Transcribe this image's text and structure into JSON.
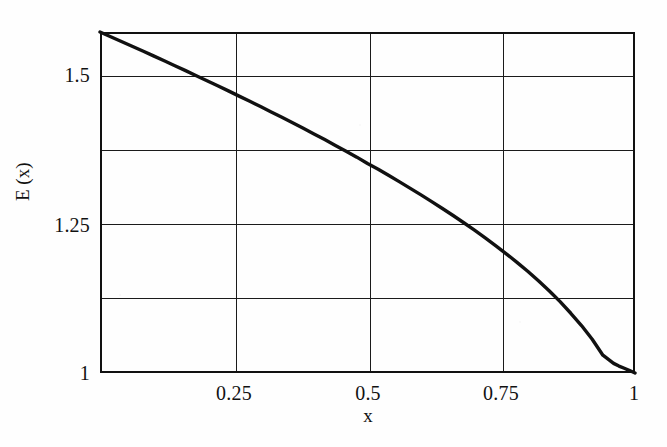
{
  "chart_data": {
    "type": "line",
    "title": "",
    "subtitle": "",
    "xlabel": "x",
    "ylabel": "E (x)",
    "xlim": [
      0,
      1
    ],
    "ylim": [
      1,
      1.5708
    ],
    "grid": true,
    "legend": null,
    "x_ticks": [
      {
        "value": 0.25,
        "label": "0.25"
      },
      {
        "value": 0.5,
        "label": "0.5"
      },
      {
        "value": 0.75,
        "label": "0.75"
      },
      {
        "value": 1,
        "label": "1"
      }
    ],
    "y_ticks": [
      {
        "value": 1.5,
        "label": "1.5"
      },
      {
        "value": 1.25,
        "label": "1.25"
      },
      {
        "value": 1,
        "label": "1"
      }
    ],
    "x_gridlines": [
      0.25,
      0.5,
      0.75
    ],
    "y_gridlines": [
      1.5,
      1.375,
      1.25,
      1.125
    ],
    "line_color": "#111111",
    "line_width": 3.4,
    "series": [
      {
        "name": "E (x)",
        "x": [
          0,
          0.02,
          0.04,
          0.06,
          0.08,
          0.1,
          0.12,
          0.14,
          0.16,
          0.18,
          0.2,
          0.22,
          0.24,
          0.26,
          0.28,
          0.3,
          0.32,
          0.34,
          0.36,
          0.38,
          0.4,
          0.42,
          0.44,
          0.46,
          0.48,
          0.5,
          0.52,
          0.54,
          0.56,
          0.58,
          0.6,
          0.62,
          0.64,
          0.66,
          0.68,
          0.7,
          0.72,
          0.74,
          0.76,
          0.78,
          0.8,
          0.82,
          0.84,
          0.86,
          0.88,
          0.9,
          0.92,
          0.94,
          0.96,
          0.97,
          0.98,
          0.99,
          0.995,
          1
        ],
        "values": [
          1.5708,
          1.5629,
          1.5549,
          1.5469,
          1.5389,
          1.5308,
          1.5226,
          1.5144,
          1.5061,
          1.4977,
          1.4893,
          1.4808,
          1.4722,
          1.4635,
          1.4548,
          1.446,
          1.437,
          1.428,
          1.4188,
          1.4096,
          1.4002,
          1.3907,
          1.381,
          1.3712,
          1.3613,
          1.3506,
          1.3409,
          1.3305,
          1.3199,
          1.3091,
          1.2981,
          1.2869,
          1.2754,
          1.2636,
          1.2515,
          1.239,
          1.2262,
          1.2129,
          1.1991,
          1.1848,
          1.1698,
          1.154,
          1.1373,
          1.1194,
          1.1,
          1.0795,
          1.0565,
          1.0298,
          1.0161,
          1.0116,
          1.0079,
          1.004,
          1.002,
          1.0
        ]
      }
    ]
  },
  "axis": {
    "y_title": "E (x)",
    "x_title": "x",
    "y_tick_labels": [
      "1.5",
      "1.25",
      "1"
    ],
    "x_tick_labels": [
      "0.25",
      "0.5",
      "0.75",
      "1"
    ]
  }
}
